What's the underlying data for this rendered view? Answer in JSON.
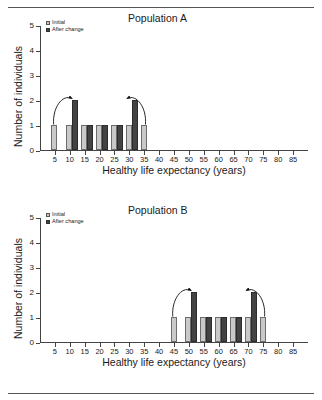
{
  "figure": {
    "rule_top": "horizontal-rule",
    "rule_bottom": "horizontal-rule"
  },
  "chart_data": [
    {
      "type": "bar",
      "title": "Population A",
      "xlabel": "Healthy life expectancy (years)",
      "ylabel": "Number of individuals",
      "xlim": [
        0,
        90
      ],
      "ylim": [
        0,
        5
      ],
      "xticks": [
        5,
        10,
        15,
        20,
        25,
        30,
        35,
        40,
        45,
        50,
        55,
        60,
        65,
        70,
        75,
        80,
        85
      ],
      "yticks": [
        0,
        1,
        2,
        3,
        4,
        5
      ],
      "grid": false,
      "legend": [
        {
          "label": "Initial",
          "color": "#c9c9c9",
          "key": "initial"
        },
        {
          "label": "After change",
          "color": "#434343",
          "key": "after"
        }
      ],
      "legend_position": "top-left",
      "categories": [
        5,
        10,
        15,
        20,
        25,
        30,
        35
      ],
      "series": [
        {
          "name": "Initial",
          "key": "initial",
          "values": [
            1,
            1,
            1,
            1,
            1,
            1,
            1
          ]
        },
        {
          "name": "After change",
          "key": "after",
          "values": [
            0,
            2,
            1,
            1,
            1,
            2,
            0
          ]
        }
      ],
      "annotations": [
        {
          "type": "curved-arrow",
          "from_x": 5,
          "from_y": 1,
          "to_x": 10,
          "to_y": 2,
          "direction": "right"
        },
        {
          "type": "curved-arrow",
          "from_x": 35,
          "from_y": 1,
          "to_x": 30,
          "to_y": 2,
          "direction": "left"
        }
      ]
    },
    {
      "type": "bar",
      "title": "Population B",
      "xlabel": "Healthy life expectancy (years)",
      "ylabel": "Number of individuals",
      "xlim": [
        0,
        90
      ],
      "ylim": [
        0,
        5
      ],
      "xticks": [
        5,
        10,
        15,
        20,
        25,
        30,
        35,
        40,
        45,
        50,
        55,
        60,
        65,
        70,
        75,
        80,
        85
      ],
      "yticks": [
        0,
        1,
        2,
        3,
        4,
        5
      ],
      "grid": false,
      "legend": [
        {
          "label": "Initial",
          "color": "#c9c9c9",
          "key": "initial"
        },
        {
          "label": "After change",
          "color": "#434343",
          "key": "after"
        }
      ],
      "legend_position": "top-left",
      "categories": [
        45,
        50,
        55,
        60,
        65,
        70,
        75
      ],
      "series": [
        {
          "name": "Initial",
          "key": "initial",
          "values": [
            1,
            1,
            1,
            1,
            1,
            1,
            1
          ]
        },
        {
          "name": "After change",
          "key": "after",
          "values": [
            0,
            2,
            1,
            1,
            1,
            2,
            0
          ]
        }
      ],
      "annotations": [
        {
          "type": "curved-arrow",
          "from_x": 45,
          "from_y": 1,
          "to_x": 50,
          "to_y": 2,
          "direction": "right"
        },
        {
          "type": "curved-arrow",
          "from_x": 75,
          "from_y": 1,
          "to_x": 70,
          "to_y": 2,
          "direction": "left"
        }
      ]
    }
  ]
}
